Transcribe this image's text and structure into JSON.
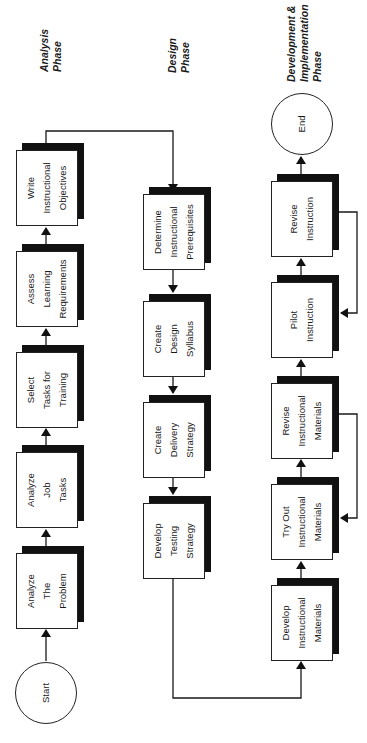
{
  "phases": [
    {
      "id": "analysis",
      "lines": [
        "Analysis",
        "Phase"
      ]
    },
    {
      "id": "design",
      "lines": [
        "Design",
        "Phase"
      ]
    },
    {
      "id": "development",
      "lines": [
        "Development &",
        "Implementation",
        "Phase"
      ]
    }
  ],
  "terminals": {
    "start": {
      "label": "Start"
    },
    "end": {
      "label": "End"
    }
  },
  "analysis_steps": [
    {
      "lines": [
        "Analyze",
        "The",
        "Problem"
      ]
    },
    {
      "lines": [
        "Analyze",
        "Job",
        "Tasks"
      ]
    },
    {
      "lines": [
        "Select",
        "Tasks for",
        "Training"
      ]
    },
    {
      "lines": [
        "Assess",
        "Learning",
        "Requirements"
      ]
    },
    {
      "lines": [
        "Write",
        "Instructional",
        "Objectives"
      ]
    }
  ],
  "design_steps": [
    {
      "lines": [
        "Determine",
        "Instructional",
        "Prerequisites"
      ]
    },
    {
      "lines": [
        "Create",
        "Design",
        "Syllabus"
      ]
    },
    {
      "lines": [
        "Create",
        "Delivery",
        "Strategy"
      ]
    },
    {
      "lines": [
        "Develop",
        "Testing",
        "Strategy"
      ]
    }
  ],
  "development_steps": [
    {
      "lines": [
        "Develop",
        "Instructional",
        "Materials"
      ]
    },
    {
      "lines": [
        "Try Out",
        "Instructional",
        "Materials"
      ]
    },
    {
      "lines": [
        "Revise",
        "Instructional",
        "Materials"
      ]
    },
    {
      "lines": [
        "Pilot",
        "Instruction"
      ]
    },
    {
      "lines": [
        "Revise",
        "Instruction"
      ]
    }
  ],
  "colors": {
    "line": "#1a1a1a",
    "shadow": "#111111",
    "background": "#ffffff"
  }
}
